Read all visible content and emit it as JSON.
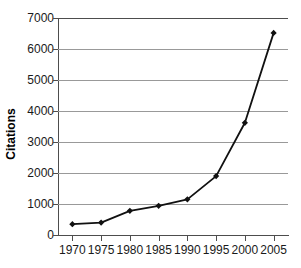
{
  "chart_data": {
    "type": "line",
    "title": "",
    "xlabel": "",
    "ylabel": "Citations",
    "x": [
      1970,
      1975,
      1980,
      1985,
      1990,
      1995,
      2000,
      2005
    ],
    "categories": [
      "1970",
      "1975",
      "1980",
      "1985",
      "1990",
      "1995",
      "2000",
      "2005"
    ],
    "values": [
      350,
      400,
      780,
      940,
      1150,
      1900,
      3620,
      6520
    ],
    "series": [
      {
        "name": "Citations",
        "values": [
          350,
          400,
          780,
          940,
          1150,
          1900,
          3620,
          6520
        ]
      }
    ],
    "ylim": [
      0,
      7000
    ],
    "xlim": [
      1967.5,
      2007.5
    ],
    "y_ticks": [
      0,
      1000,
      2000,
      3000,
      4000,
      5000,
      6000,
      7000
    ],
    "y_tick_labels": [
      "0",
      "1000",
      "2000",
      "3000",
      "4000",
      "5000",
      "6000",
      "7000"
    ],
    "x_ticks": [
      1970,
      1975,
      1980,
      1985,
      1990,
      1995,
      2000,
      2005
    ],
    "grid": true,
    "grid_axis": "y",
    "legend": false,
    "legend_position": "none",
    "marker": "diamond",
    "line_color": "#111111",
    "marker_color": "#111111",
    "grid_color": "#999999",
    "axis_color": "#4d4d4d",
    "background": "#ffffff"
  },
  "axes": {
    "y_title": "Citations"
  }
}
